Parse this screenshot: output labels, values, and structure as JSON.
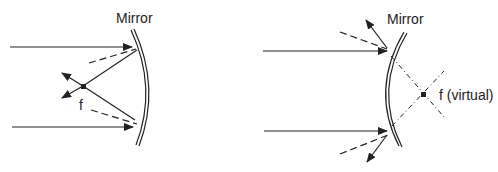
{
  "diagrams": [
    {
      "id": "concave",
      "mirror_label": "Mirror",
      "focal_label": "f"
    },
    {
      "id": "convex",
      "mirror_label": "Mirror",
      "focal_label": "f (virtual)"
    }
  ],
  "colors": {
    "stroke": "#222222",
    "background": "#ffffff"
  }
}
